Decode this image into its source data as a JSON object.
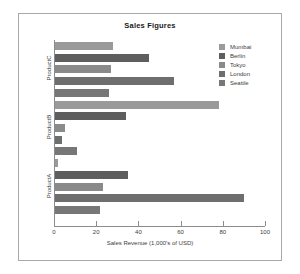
{
  "chart_data": {
    "type": "bar",
    "orientation": "horizontal",
    "title": "Sales Figures",
    "xlabel": "Sales Revenue (1,000's of USD)",
    "ylabel": "",
    "xlim": [
      0,
      100
    ],
    "xticks": [
      0,
      20,
      40,
      60,
      80,
      100
    ],
    "grid": false,
    "legend_position": "upper right",
    "categories": [
      "ProductA",
      "ProductB",
      "ProductC"
    ],
    "series": [
      {
        "name": "Mumbai",
        "color": "#9a9a9a",
        "values": [
          2,
          78,
          28
        ]
      },
      {
        "name": "Berlin",
        "color": "#5e5e5e",
        "values": [
          35,
          34,
          45
        ]
      },
      {
        "name": "Tokyo",
        "color": "#8a8a8a",
        "values": [
          23,
          5,
          27
        ]
      },
      {
        "name": "London",
        "color": "#6e6e6e",
        "values": [
          90,
          4,
          57
        ]
      },
      {
        "name": "Seattle",
        "color": "#777777",
        "values": [
          22,
          11,
          26
        ]
      }
    ]
  },
  "legend": {
    "items": [
      {
        "label": "Mumbai"
      },
      {
        "label": "Berlin"
      },
      {
        "label": "Tokyo"
      },
      {
        "label": "London"
      },
      {
        "label": "Seattle"
      }
    ]
  }
}
